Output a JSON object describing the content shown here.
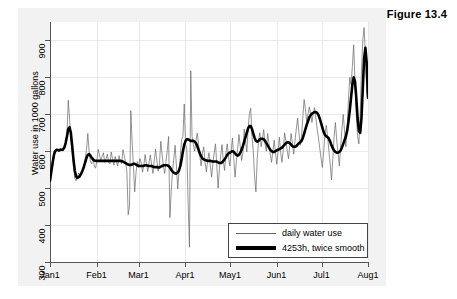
{
  "figure": {
    "caption": "Figure 13.4"
  },
  "chart_data": {
    "type": "line",
    "title": "",
    "xlabel": "",
    "ylabel": "Water use in 1000 gallons",
    "ylim": [
      300,
      950
    ],
    "yticks": [
      300,
      400,
      500,
      600,
      700,
      800,
      900
    ],
    "xticks": [
      "Jan1",
      "Feb1",
      "Mar1",
      "Apr1",
      "May1",
      "Jun1",
      "Jul1",
      "Aug1"
    ],
    "xlim_days": [
      0,
      212
    ],
    "xtick_days": [
      0,
      31,
      59,
      90,
      120,
      151,
      181,
      212
    ],
    "grid": true,
    "legend_position": "bottom-right",
    "series": [
      {
        "name": "daily water use",
        "style": "thin",
        "color": "#666666",
        "values": [
          520,
          545,
          560,
          600,
          595,
          604,
          601,
          598,
          608,
          603,
          600,
          612,
          620,
          645,
          738,
          690,
          632,
          600,
          560,
          527,
          520,
          533,
          541,
          528,
          536,
          548,
          560,
          580,
          604,
          648,
          600,
          572,
          566,
          583,
          560,
          554,
          575,
          605,
          590,
          572,
          586,
          596,
          570,
          580,
          592,
          570,
          566,
          598,
          580,
          562,
          586,
          571,
          560,
          588,
          572,
          566,
          604,
          588,
          570,
          545,
          428,
          452,
          710,
          626,
          558,
          490,
          543,
          572,
          556,
          580,
          568,
          543,
          562,
          591,
          566,
          545,
          570,
          590,
          562,
          540,
          576,
          606,
          574,
          546,
          566,
          627,
          592,
          560,
          540,
          572,
          603,
          640,
          420,
          490,
          545,
          580,
          616,
          560,
          498,
          545,
          588,
          632,
          640,
          728,
          620,
          605,
          458,
          340,
          818,
          640,
          618,
          600,
          630,
          649,
          618,
          586,
          560,
          596,
          612,
          570,
          544,
          576,
          596,
          560,
          530,
          568,
          596,
          620,
          560,
          500,
          552,
          590,
          618,
          572,
          548,
          596,
          620,
          584,
          560,
          600,
          636,
          580,
          530,
          572,
          608,
          645,
          612,
          575,
          595,
          660,
          628,
          598,
          660,
          702,
          716,
          640,
          600,
          530,
          490,
          580,
          628,
          650,
          612,
          636,
          658,
          620,
          600,
          648,
          622,
          591,
          570,
          600,
          630,
          596,
          565,
          600,
          638,
          596,
          570,
          604,
          650,
          628,
          602,
          580,
          616,
          648,
          622,
          592,
          630,
          660,
          690,
          650,
          616,
          640,
          692,
          740,
          712,
          680,
          702,
          720,
          700,
          678,
          702,
          718,
          690,
          660,
          636,
          608,
          580,
          556,
          600,
          648,
          670,
          640,
          600,
          566,
          522,
          580,
          640,
          678,
          630,
          596,
          560,
          612,
          660,
          700,
          655,
          612,
          660,
          740,
          800,
          780,
          830,
          888,
          790,
          700,
          640,
          620,
          700,
          820,
          900,
          935,
          860,
          760,
          745
        ]
      },
      {
        "name": "4253h, twice smooth",
        "style": "thick",
        "color": "#000000",
        "values": [
          520,
          545,
          568,
          590,
          600,
          604,
          603,
          602,
          604,
          604,
          605,
          610,
          622,
          640,
          660,
          665,
          650,
          615,
          578,
          548,
          532,
          528,
          530,
          534,
          540,
          548,
          558,
          570,
          582,
          590,
          592,
          588,
          582,
          578,
          575,
          574,
          574,
          574,
          574,
          574,
          574,
          574,
          574,
          574,
          574,
          574,
          574,
          574,
          574,
          574,
          574,
          574,
          574,
          574,
          574,
          573,
          572,
          570,
          568,
          566,
          564,
          563,
          563,
          564,
          566,
          566,
          564,
          562,
          560,
          560,
          560,
          560,
          561,
          562,
          562,
          561,
          560,
          560,
          560,
          558,
          557,
          557,
          557,
          556,
          556,
          558,
          560,
          562,
          562,
          562,
          562,
          560,
          556,
          550,
          545,
          542,
          540,
          540,
          542,
          548,
          560,
          578,
          600,
          618,
          628,
          632,
          632,
          630,
          628,
          628,
          628,
          626,
          622,
          614,
          604,
          594,
          586,
          580,
          578,
          576,
          575,
          574,
          574,
          574,
          573,
          572,
          572,
          572,
          572,
          570,
          568,
          568,
          570,
          574,
          578,
          584,
          590,
          594,
          596,
          598,
          600,
          598,
          594,
          590,
          588,
          590,
          596,
          604,
          614,
          626,
          638,
          650,
          662,
          668,
          668,
          660,
          648,
          636,
          628,
          626,
          628,
          632,
          634,
          634,
          632,
          628,
          622,
          616,
          610,
          604,
          600,
          598,
          598,
          600,
          602,
          604,
          606,
          608,
          610,
          614,
          618,
          622,
          624,
          624,
          622,
          618,
          614,
          612,
          612,
          614,
          618,
          622,
          624,
          628,
          636,
          648,
          660,
          672,
          682,
          692,
          698,
          702,
          704,
          706,
          706,
          704,
          698,
          688,
          676,
          664,
          652,
          644,
          640,
          638,
          634,
          626,
          616,
          608,
          602,
          598,
          596,
          596,
          598,
          602,
          610,
          620,
          630,
          640,
          655,
          680,
          710,
          745,
          780,
          800,
          790,
          745,
          690,
          655,
          650,
          690,
          770,
          850,
          880,
          840,
          745
        ]
      }
    ]
  },
  "legend": {
    "items": [
      {
        "label": "daily water use",
        "key": "thin-line-key"
      },
      {
        "label": "4253h, twice smooth",
        "key": "thick-line-key"
      }
    ]
  }
}
